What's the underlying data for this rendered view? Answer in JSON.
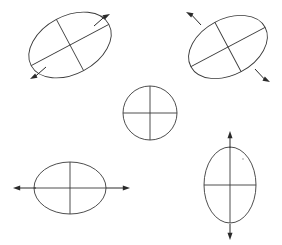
{
  "figure": {
    "kind": "strain-ellipse-diagram",
    "background_color": "#ffffff",
    "stroke_color": "#3a3a3a",
    "arrow_color": "#2a2a2a",
    "width": 282,
    "height": 245,
    "title": "",
    "caption": ""
  },
  "elements": [
    {
      "id": "top-left",
      "name": "strain-ellipse-top-left",
      "shape": "ellipse",
      "center": [
        70,
        45
      ],
      "radius_major": 44,
      "radius_minor": 29,
      "rotation_deg": -28,
      "has_arrows": true,
      "arrow_axis": "major",
      "arrow_direction_label": "NE-SW",
      "arrows": [
        {
          "name": "arrow-northeast",
          "angle_deg": -28,
          "tip": [
            110,
            14
          ],
          "tail": [
            94,
            26
          ]
        },
        {
          "name": "arrow-southwest",
          "angle_deg": 152,
          "tip": [
            30,
            79
          ],
          "tail": [
            46,
            67
          ]
        }
      ]
    },
    {
      "id": "top-right",
      "name": "strain-ellipse-top-right",
      "shape": "ellipse",
      "center": [
        228,
        47
      ],
      "radius_major": 42,
      "radius_minor": 28,
      "rotation_deg": -28,
      "has_arrows": true,
      "arrow_axis": "minor",
      "arrow_direction_label": "NW-SE",
      "arrows": [
        {
          "name": "arrow-northwest",
          "angle_deg": -152,
          "tip": [
            186,
            12
          ],
          "tail": [
            201,
            25
          ]
        },
        {
          "name": "arrow-southeast",
          "angle_deg": 28,
          "tip": [
            270,
            82
          ],
          "tail": [
            255,
            69
          ]
        }
      ]
    },
    {
      "id": "center",
      "name": "strain-circle-center",
      "shape": "circle",
      "center": [
        150,
        113
      ],
      "radius_major": 27,
      "radius_minor": 27,
      "rotation_deg": 0,
      "has_arrows": false,
      "arrow_axis": "none",
      "arrow_direction_label": "none",
      "arrows": []
    },
    {
      "id": "bottom-left",
      "name": "strain-ellipse-bottom-left",
      "shape": "ellipse",
      "center": [
        70,
        188
      ],
      "radius_major": 36,
      "radius_minor": 26,
      "rotation_deg": 0,
      "has_arrows": true,
      "arrow_axis": "major",
      "arrow_direction_label": "E-W",
      "arrows": [
        {
          "name": "arrow-west",
          "angle_deg": 180,
          "tip": [
            13,
            188
          ],
          "tail": [
            36,
            188
          ]
        },
        {
          "name": "arrow-east",
          "angle_deg": 0,
          "tip": [
            130,
            188
          ],
          "tail": [
            106,
            188
          ]
        }
      ]
    },
    {
      "id": "bottom-right",
      "name": "strain-ellipse-bottom-right",
      "shape": "ellipse",
      "center": [
        230,
        185
      ],
      "radius_major": 38,
      "radius_minor": 26,
      "rotation_deg": 90,
      "has_arrows": true,
      "arrow_axis": "major",
      "arrow_direction_label": "N-S",
      "arrows": [
        {
          "name": "arrow-north",
          "angle_deg": -90,
          "tip": [
            230,
            131
          ],
          "tail": [
            230,
            148
          ]
        },
        {
          "name": "arrow-south",
          "angle_deg": 90,
          "tip": [
            230,
            240
          ],
          "tail": [
            230,
            224
          ]
        }
      ]
    }
  ],
  "speck": {
    "name": "stray-speck",
    "center": [
      243,
      159
    ],
    "radius": 1.1
  }
}
